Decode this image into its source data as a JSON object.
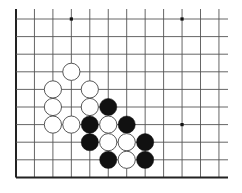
{
  "board": {
    "columns": 12,
    "rows": 10,
    "origin_x": 16,
    "origin_y": 19,
    "col_spacing": 18.45,
    "row_spacing": 17.6,
    "line_top": 9,
    "line_right": 228,
    "edges": [
      "left",
      "bottom"
    ],
    "line_color": "#555555",
    "edge_color": "#222222",
    "stone_radius": 8.6
  },
  "star_points": [
    {
      "col": 3,
      "row": 0
    },
    {
      "col": 9,
      "row": 0
    },
    {
      "col": 9,
      "row": 6
    }
  ],
  "stones": [
    {
      "color": "white",
      "col": 3,
      "row": 3
    },
    {
      "color": "white",
      "col": 2,
      "row": 4
    },
    {
      "color": "white",
      "col": 4,
      "row": 4
    },
    {
      "color": "white",
      "col": 2,
      "row": 5
    },
    {
      "color": "white",
      "col": 4,
      "row": 5
    },
    {
      "color": "black",
      "col": 5,
      "row": 5
    },
    {
      "color": "white",
      "col": 2,
      "row": 6
    },
    {
      "color": "white",
      "col": 3,
      "row": 6
    },
    {
      "color": "black",
      "col": 4,
      "row": 6
    },
    {
      "color": "white",
      "col": 5,
      "row": 6
    },
    {
      "color": "black",
      "col": 6,
      "row": 6
    },
    {
      "color": "black",
      "col": 4,
      "row": 7
    },
    {
      "color": "white",
      "col": 5,
      "row": 7
    },
    {
      "color": "white",
      "col": 6,
      "row": 7
    },
    {
      "color": "black",
      "col": 7,
      "row": 7
    },
    {
      "color": "black",
      "col": 5,
      "row": 8
    },
    {
      "color": "white",
      "col": 6,
      "row": 8
    },
    {
      "color": "black",
      "col": 7,
      "row": 8
    }
  ],
  "colors": {
    "black_stone": "#111111",
    "white_stone": "#ffffff",
    "white_stone_border": "#444444",
    "star_point": "#111111"
  }
}
